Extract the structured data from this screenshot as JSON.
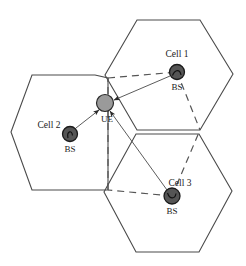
{
  "figure": {
    "background_color": "#ffffff",
    "width": 246,
    "height": 266
  },
  "colors": {
    "hexagon_stroke": "#4a4a4a",
    "dashed_stroke": "#555555",
    "bs_fill": "#555555",
    "bs_stroke": "#1a1a1a",
    "ue_fill": "#9a9a9a",
    "ue_stroke": "#2a2a2a",
    "arrow_stroke": "#4a4a4a",
    "text": "#1a1a1a"
  },
  "cells": [
    {
      "id": "cell-1",
      "cell_label": "Cell 1",
      "bs_label": "BS",
      "center": {
        "x": 177,
        "y": 72
      },
      "cell_label_pos": {
        "x": 177,
        "y": 57
      },
      "bs_label_pos": {
        "x": 177,
        "y": 90
      },
      "hexagon_center": {
        "x": 184,
        "y": 74
      },
      "bs_radius": 7.5
    },
    {
      "id": "cell-2",
      "cell_label": "Cell 2",
      "bs_label": "BS",
      "center": {
        "x": 70,
        "y": 134
      },
      "cell_label_pos": {
        "x": 49,
        "y": 128
      },
      "bs_label_pos": {
        "x": 70,
        "y": 152
      },
      "hexagon_center": {
        "x": 61,
        "y": 132
      },
      "bs_radius": 7.5
    },
    {
      "id": "cell-3",
      "cell_label": "Cell 3",
      "bs_label": "BS",
      "center": {
        "x": 172,
        "y": 196
      },
      "cell_label_pos": {
        "x": 180,
        "y": 186
      },
      "bs_label_pos": {
        "x": 172,
        "y": 214
      },
      "hexagon_center": {
        "x": 167,
        "y": 193
      },
      "bs_radius": 8
    }
  ],
  "ue": {
    "id": "ue",
    "label": "UE",
    "center": {
      "x": 105,
      "y": 103
    },
    "radius": 8.5,
    "label_pos": {
      "x": 107,
      "y": 122
    }
  },
  "hexagons": [
    {
      "name": "hexagon-cell-1",
      "points": "137,20 200,20 233,74 200,130 137,130 105,75"
    },
    {
      "name": "hexagon-cell-2",
      "points": "32,75 95,75 108,78 108,190 32,190 11,132"
    },
    {
      "name": "hexagon-cell-3",
      "points": "136,134 199,134 232,191 199,252 136,252 104,192"
    }
  ],
  "dashed_paths": [
    {
      "name": "dashed-edge-top",
      "d": "M 108,78 L 177,72"
    },
    {
      "name": "dashed-edge-cell1-right",
      "d": "M 177,72 L 200,130"
    },
    {
      "name": "dashed-edge-cell3-right",
      "d": "M 172,196 L 200,130"
    },
    {
      "name": "dashed-edge-bottom",
      "d": "M 172,196 L 108,190"
    },
    {
      "name": "dashed-edge-cell2-left",
      "d": "M 108,190 L 108,78"
    }
  ],
  "arrows": [
    {
      "name": "arrow-bs1-to-ue",
      "from": "cell-1",
      "to": "ue",
      "x1": 170,
      "y1": 76,
      "x2": 114,
      "y2": 100
    },
    {
      "name": "arrow-bs2-to-ue",
      "from": "cell-2",
      "to": "ue",
      "x1": 76,
      "y1": 128,
      "x2": 99,
      "y2": 110
    },
    {
      "name": "arrow-bs3-to-ue",
      "from": "cell-3",
      "to": "ue",
      "x1": 167,
      "y1": 190,
      "x2": 110,
      "y2": 111
    }
  ],
  "legend": {
    "bs_meaning": "BS",
    "ue_meaning": "UE"
  }
}
